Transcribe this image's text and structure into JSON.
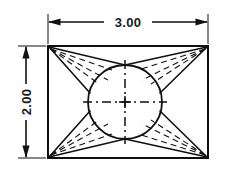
{
  "drawing": {
    "title": "Rectangular block with inscribed circle - orthographic view",
    "background_color": "#ffffff",
    "line_color": "#111111",
    "dimensions": {
      "horizontal": {
        "label": "3.00",
        "units": "inches",
        "orientation": "horizontal",
        "position": "top"
      },
      "vertical": {
        "label": "2.00",
        "units": "inches",
        "orientation": "vertical-rotated",
        "position": "left"
      }
    },
    "geometry": {
      "rectangle": {
        "name": "outer-profile",
        "x": 48,
        "y": 46,
        "width": 160,
        "height": 112,
        "stroke_width": 2.0
      },
      "circle": {
        "name": "inscribed-circle",
        "cx": 125,
        "cy": 102,
        "r": 37,
        "stroke_width": 1.8
      },
      "center_mark": {
        "cx": 125,
        "cy": 102,
        "arm": 5
      },
      "centerlines": {
        "horizontal": {
          "x1": 84,
          "y1": 102,
          "x2": 166,
          "y2": 102
        },
        "vertical": {
          "x1": 125,
          "y1": 61,
          "x2": 125,
          "y2": 143
        },
        "dash": "9 4 2 4"
      },
      "solid_tangents": [
        {
          "from": [
            48,
            46
          ],
          "to": [
            97.8,
            76.8
          ]
        },
        {
          "from": [
            48,
            46
          ],
          "to": [
            101.5,
            71.3
          ]
        },
        {
          "from": [
            208,
            46
          ],
          "to": [
            152.2,
            76.8
          ]
        },
        {
          "from": [
            208,
            46
          ],
          "to": [
            148.5,
            71.3
          ]
        },
        {
          "from": [
            48,
            158
          ],
          "to": [
            97.8,
            127.2
          ]
        },
        {
          "from": [
            48,
            158
          ],
          "to": [
            101.5,
            132.7
          ]
        },
        {
          "from": [
            208,
            158
          ],
          "to": [
            152.2,
            127.2
          ]
        },
        {
          "from": [
            208,
            158
          ],
          "to": [
            148.5,
            132.7
          ]
        }
      ],
      "hidden_lines_dash": "6 4",
      "hidden_line_count_per_corner": 3
    }
  }
}
